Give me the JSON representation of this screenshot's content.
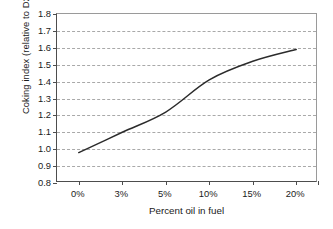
{
  "chart_data": {
    "type": "line",
    "title": "",
    "xlabel": "Percent oil in fuel",
    "ylabel": "Coking index (relative to D2)",
    "categories": [
      "0%",
      "3%",
      "5%",
      "10%",
      "15%",
      "20%"
    ],
    "values": [
      0.98,
      1.1,
      1.22,
      1.41,
      1.52,
      1.59
    ],
    "series": [
      {
        "name": "Coking index",
        "values": [
          0.98,
          1.1,
          1.22,
          1.41,
          1.52,
          1.59
        ]
      }
    ],
    "ylim": [
      0.8,
      1.8
    ],
    "ytick_labels": [
      "1.8",
      "1.7",
      "1.6",
      "1.5",
      "1.4",
      "1.3",
      "1.2",
      "1.1",
      "1.0",
      "0.9",
      "0.8"
    ],
    "ytick_values": [
      1.8,
      1.7,
      1.6,
      1.5,
      1.4,
      1.3,
      1.2,
      1.1,
      1.0,
      0.9,
      0.8
    ],
    "grid": true,
    "grid_axis": "y",
    "legend": false,
    "legend_position": "none",
    "line_color": "#2b2b2b",
    "grid_color": "#a9a9a9",
    "axis_color": "#4d4d4d",
    "background_color": "#ffffff",
    "markers": false,
    "smoothing": "smooth"
  },
  "caption": ""
}
